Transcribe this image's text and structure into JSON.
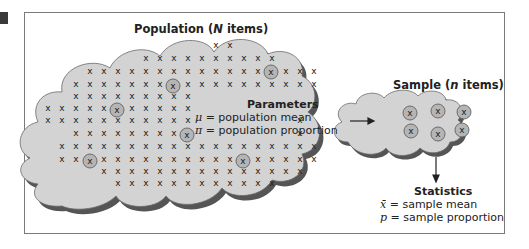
{
  "figure": {
    "population": {
      "title_prefix": "Population (",
      "title_var": "N",
      "title_suffix": " items)",
      "item_glyph": "x",
      "parameters": {
        "heading": "Parameters",
        "lines": [
          {
            "symbol": "μ",
            "text": " = population mean"
          },
          {
            "symbol": "π",
            "text": " = population proportion"
          }
        ]
      }
    },
    "sample": {
      "title_prefix": "Sample (",
      "title_var": "n",
      "title_suffix": " items)",
      "item_count": 6
    },
    "statistics": {
      "heading": "Statistics",
      "lines": [
        {
          "symbol": "x̄",
          "text": " = sample mean"
        },
        {
          "symbol": "p",
          "text": " = sample proportion"
        }
      ]
    },
    "colors": {
      "cloud_fill": "#d3d3d3",
      "cloud_shadow": "#555555",
      "sampled_circle": "#b5b5b5",
      "frame": "#7a7a7a",
      "text": "#222222"
    }
  }
}
